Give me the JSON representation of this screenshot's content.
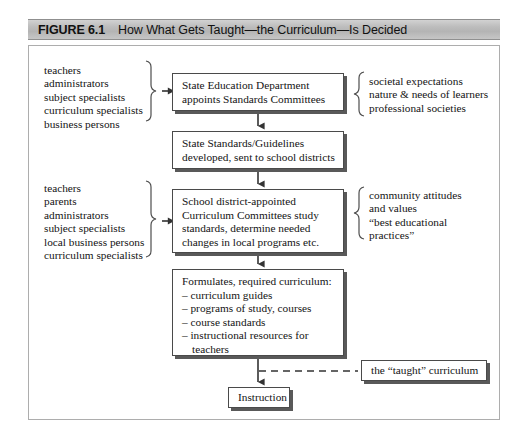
{
  "figure": {
    "number_label": "FIGURE 6.1",
    "title": "How What Gets Taught—the Curriculum—Is Decided"
  },
  "colors": {
    "caption_bar": "#bdbdbd",
    "panel_border": "#adadad",
    "box_border": "#4a4a4a",
    "box_shadow": "#595959",
    "text": "#141414"
  },
  "flow": {
    "box_state_education": {
      "lines": [
        "State Education Department",
        "appoints Standards Committees"
      ]
    },
    "box_state_standards": {
      "lines": [
        "State Standards/Guidelines",
        "developed, sent to school districts"
      ]
    },
    "box_curriculum_committees": {
      "lines": [
        "School district-appointed",
        "Curriculum Committees study",
        "standards, determine needed",
        "changes in local programs etc."
      ]
    },
    "box_formulates": {
      "heading": "Formulates, required curriculum:",
      "items": [
        "– curriculum guides",
        "– programs of study, courses",
        "– course standards",
        "– instructional resources for"
      ],
      "item_continuation": "teachers"
    },
    "box_taught_curriculum": {
      "label": "the “taught” curriculum"
    },
    "box_instruction": {
      "label": "Instruction"
    }
  },
  "labels": {
    "left_group_1": {
      "lines": [
        "teachers",
        "administrators",
        "subject specialists",
        "curriculum specialists",
        "business persons"
      ]
    },
    "left_group_2": {
      "lines": [
        "teachers",
        "parents",
        "administrators",
        "subject specialists",
        "local business persons",
        "curriculum specialists"
      ]
    },
    "right_group_1": {
      "lines": [
        "societal expectations",
        "nature & needs of learners",
        "professional societies"
      ]
    },
    "right_group_2": {
      "lines": [
        "community attitudes",
        "and values",
        "“best educational",
        "practices”"
      ]
    }
  }
}
